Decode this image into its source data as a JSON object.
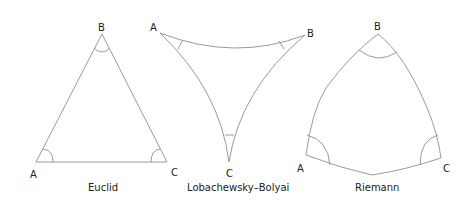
{
  "diagrams": [
    {
      "name": "euclid",
      "caption": "Euclid",
      "vertices": {
        "A": "A",
        "B": "B",
        "C": "C"
      }
    },
    {
      "name": "lobachevsky-bolyai",
      "caption": "Lobachewsky–Bolyai",
      "vertices": {
        "A": "A",
        "B": "B",
        "C": "C"
      }
    },
    {
      "name": "riemann",
      "caption": "Riemann",
      "vertices": {
        "A": "A",
        "B": "B",
        "C": "C"
      }
    }
  ],
  "colors": {
    "stroke": "#9a9a9a",
    "text": "#222222"
  }
}
